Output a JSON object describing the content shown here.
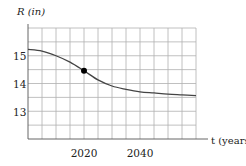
{
  "chart_data": {
    "type": "line",
    "title": "",
    "xlabel": "t (years)",
    "ylabel": "R (in)",
    "xlim": [
      2000,
      2060
    ],
    "ylim": [
      12,
      16
    ],
    "grid": true,
    "x_grid_step": 5,
    "y_grid_step": 0.5,
    "x_tick_labels": [
      "2020",
      "2040"
    ],
    "x_ticks": [
      2020,
      2040
    ],
    "y_tick_labels": [
      "13",
      "14",
      "15"
    ],
    "y_ticks": [
      13,
      14,
      15
    ],
    "series": [
      {
        "name": "R(t)",
        "x": [
          2000,
          2005,
          2010,
          2015,
          2020,
          2025,
          2030,
          2035,
          2040,
          2045,
          2050,
          2055,
          2060
        ],
        "values": [
          15.23,
          15.17,
          15.0,
          14.77,
          14.46,
          14.13,
          13.91,
          13.79,
          13.7,
          13.66,
          13.62,
          13.59,
          13.56
        ]
      }
    ],
    "annotations": [
      {
        "type": "point",
        "x": 2020,
        "y": 14.46,
        "marker": "filled-circle"
      }
    ],
    "legend": null
  },
  "labels": {
    "y_axis": "R (in)",
    "x_axis": "t (years)",
    "x_tick_2020": "2020",
    "x_tick_2040": "2040",
    "y_tick_13": "13",
    "y_tick_14": "14",
    "y_tick_15": "15"
  },
  "colors": {
    "curve": "#444444",
    "grid": "#b0b0b0",
    "point": "#000000"
  }
}
